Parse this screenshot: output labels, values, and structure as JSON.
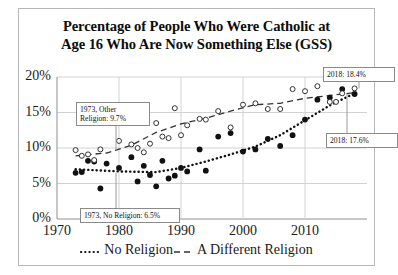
{
  "chart_data": {
    "type": "scatter",
    "title": "Percentage of People Who Were Catholic at Age 16 Who Are Now Something Else (GSS)",
    "title_line1": "Percentage of People Who Were Catholic at",
    "title_line2": "Age 16 Who Are Now Something Else (GSS)",
    "xlabel": "",
    "ylabel": "",
    "xlim": [
      1970,
      2020
    ],
    "ylim": [
      0,
      20
    ],
    "xticks": [
      1970,
      1980,
      1990,
      2000,
      2010
    ],
    "xtick_labels": [
      "1970",
      "1980",
      "1990",
      "2000",
      "2010"
    ],
    "yticks": [
      0,
      5,
      10,
      15,
      20
    ],
    "ytick_labels": [
      "0%",
      "5%",
      "10%",
      "15%",
      "20%"
    ],
    "grid": true,
    "legend_position": "bottom",
    "series": [
      {
        "name": "No Religion",
        "marker": "filled-circle",
        "trend_style": "dotted",
        "color": "#111111",
        "points": [
          {
            "x": 1973,
            "y": 6.5
          },
          {
            "x": 1974,
            "y": 6.6
          },
          {
            "x": 1975,
            "y": 8.2
          },
          {
            "x": 1976,
            "y": 8.1
          },
          {
            "x": 1977,
            "y": 4.3
          },
          {
            "x": 1978,
            "y": 7.8
          },
          {
            "x": 1980,
            "y": 7.2
          },
          {
            "x": 1982,
            "y": 8.7
          },
          {
            "x": 1983,
            "y": 5.3
          },
          {
            "x": 1984,
            "y": 7.5
          },
          {
            "x": 1985,
            "y": 6.2
          },
          {
            "x": 1986,
            "y": 4.6
          },
          {
            "x": 1987,
            "y": 8.2
          },
          {
            "x": 1988,
            "y": 5.7
          },
          {
            "x": 1989,
            "y": 6.1
          },
          {
            "x": 1990,
            "y": 7.2
          },
          {
            "x": 1991,
            "y": 6.7
          },
          {
            "x": 1993,
            "y": 9.8
          },
          {
            "x": 1994,
            "y": 6.8
          },
          {
            "x": 1996,
            "y": 11.6
          },
          {
            "x": 1998,
            "y": 12.1
          },
          {
            "x": 2000,
            "y": 9.5
          },
          {
            "x": 2002,
            "y": 9.8
          },
          {
            "x": 2004,
            "y": 11.3
          },
          {
            "x": 2006,
            "y": 10.3
          },
          {
            "x": 2008,
            "y": 11.8
          },
          {
            "x": 2010,
            "y": 14.0
          },
          {
            "x": 2012,
            "y": 16.8
          },
          {
            "x": 2014,
            "y": 17.1
          },
          {
            "x": 2016,
            "y": 18.3
          },
          {
            "x": 2018,
            "y": 17.6
          }
        ],
        "trend": [
          {
            "x": 1973,
            "y": 7.0
          },
          {
            "x": 1980,
            "y": 6.7
          },
          {
            "x": 1986,
            "y": 6.6
          },
          {
            "x": 1990,
            "y": 7.2
          },
          {
            "x": 1994,
            "y": 8.1
          },
          {
            "x": 1998,
            "y": 9.1
          },
          {
            "x": 2002,
            "y": 10.2
          },
          {
            "x": 2006,
            "y": 11.8
          },
          {
            "x": 2010,
            "y": 13.9
          },
          {
            "x": 2014,
            "y": 16.0
          },
          {
            "x": 2018,
            "y": 17.7
          }
        ]
      },
      {
        "name": "A Different Religion",
        "marker": "open-circle",
        "trend_style": "dashed",
        "color": "#333333",
        "points": [
          {
            "x": 1973,
            "y": 9.7
          },
          {
            "x": 1974,
            "y": 8.9
          },
          {
            "x": 1975,
            "y": 9.1
          },
          {
            "x": 1976,
            "y": 8.3
          },
          {
            "x": 1977,
            "y": 9.8
          },
          {
            "x": 1980,
            "y": 11.0
          },
          {
            "x": 1982,
            "y": 10.5
          },
          {
            "x": 1983,
            "y": 10.0
          },
          {
            "x": 1984,
            "y": 9.4
          },
          {
            "x": 1985,
            "y": 10.6
          },
          {
            "x": 1986,
            "y": 13.5
          },
          {
            "x": 1987,
            "y": 11.6
          },
          {
            "x": 1988,
            "y": 11.4
          },
          {
            "x": 1989,
            "y": 15.6
          },
          {
            "x": 1990,
            "y": 11.8
          },
          {
            "x": 1991,
            "y": 13.2
          },
          {
            "x": 1993,
            "y": 14.1
          },
          {
            "x": 1994,
            "y": 14.0
          },
          {
            "x": 1996,
            "y": 15.2
          },
          {
            "x": 1998,
            "y": 12.9
          },
          {
            "x": 2000,
            "y": 16.1
          },
          {
            "x": 2002,
            "y": 16.3
          },
          {
            "x": 2004,
            "y": 15.5
          },
          {
            "x": 2006,
            "y": 15.5
          },
          {
            "x": 2008,
            "y": 18.3
          },
          {
            "x": 2010,
            "y": 18.0
          },
          {
            "x": 2012,
            "y": 18.7
          },
          {
            "x": 2014,
            "y": 16.5
          },
          {
            "x": 2015,
            "y": 16.5
          },
          {
            "x": 2016,
            "y": 17.7
          },
          {
            "x": 2018,
            "y": 18.4
          }
        ],
        "trend": [
          {
            "x": 1973,
            "y": 8.9
          },
          {
            "x": 1978,
            "y": 9.3
          },
          {
            "x": 1982,
            "y": 10.4
          },
          {
            "x": 1986,
            "y": 12.2
          },
          {
            "x": 1990,
            "y": 13.4
          },
          {
            "x": 1994,
            "y": 14.2
          },
          {
            "x": 1998,
            "y": 15.2
          },
          {
            "x": 2002,
            "y": 16.1
          },
          {
            "x": 2006,
            "y": 16.3
          },
          {
            "x": 2010,
            "y": 17.0
          },
          {
            "x": 2014,
            "y": 17.4
          },
          {
            "x": 2018,
            "y": 17.8
          }
        ]
      }
    ],
    "annotations": [
      {
        "id": "other-1973",
        "text": "1973, Other\nReligion: 9.7%",
        "line1": "1973, Other",
        "line2": "Religion: 9.7%",
        "target_x": 1973,
        "target_y": 9.7
      },
      {
        "id": "norel-1973",
        "text": "1973, No Religion: 6.5%",
        "line1": "1973, No Religion: 6.5%",
        "line2": "",
        "target_x": 1973,
        "target_y": 6.5
      },
      {
        "id": "other-2018",
        "text": "2018: 18.4%",
        "line1": "2018: 18.4%",
        "line2": "",
        "target_x": 2018,
        "target_y": 18.4
      },
      {
        "id": "norel-2018",
        "text": "2018: 17.6%",
        "line1": "2018: 17.6%",
        "line2": "",
        "target_x": 2018,
        "target_y": 17.6
      }
    ],
    "legend": [
      {
        "label": "No Religion",
        "style": "dotted"
      },
      {
        "label": "A Different Religion",
        "style": "dashed"
      }
    ]
  }
}
